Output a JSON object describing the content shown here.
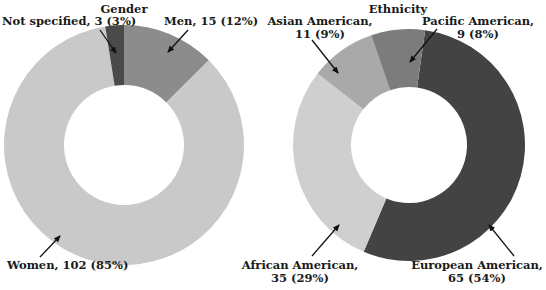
{
  "chart_data": [
    {
      "type": "pie",
      "variant": "donut",
      "title": "Gender",
      "categories": [
        "Men",
        "Women",
        "Not specified"
      ],
      "values": [
        15,
        102,
        3
      ],
      "percentages": [
        12,
        85,
        3
      ],
      "colors": [
        "#8c8c8c",
        "#c9c9c9",
        "#4a4a4a"
      ],
      "labels": [
        "Men, 15 (12%)",
        "Women, 102 (85%)",
        "Not specified, 3 (3%)"
      ],
      "start_angle_deg": 0,
      "direction": "clockwise"
    },
    {
      "type": "pie",
      "variant": "donut",
      "title": "Ethnicity",
      "categories": [
        "European American",
        "African American",
        "Asian American",
        "Pacific American"
      ],
      "values": [
        65,
        35,
        11,
        9
      ],
      "percentages": [
        54,
        29,
        9,
        8
      ],
      "colors": [
        "#434343",
        "#cfcfcf",
        "#a9a9a9",
        "#7c7c7c"
      ],
      "labels": [
        [
          "European American,",
          "65 (54%)"
        ],
        [
          "African American,",
          "35 (29%)"
        ],
        [
          "Asian American,",
          "11 (9%)"
        ],
        [
          "Pacific American,",
          "9 (8%)"
        ]
      ],
      "start_angle_deg": 8,
      "direction": "clockwise"
    }
  ]
}
